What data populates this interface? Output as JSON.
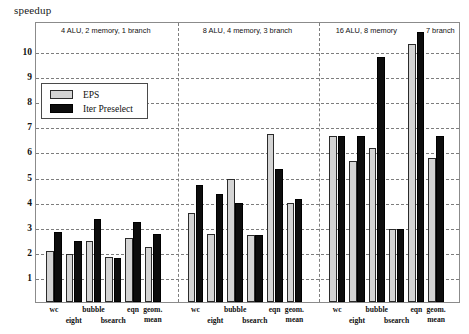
{
  "chart_data": {
    "type": "bar",
    "title": "",
    "ylabel": "speedup",
    "xlabel": "",
    "ylim": [
      0,
      11.2
    ],
    "yticks": [
      1,
      2,
      3,
      4,
      5,
      6,
      7,
      8,
      9,
      10
    ],
    "grid": true,
    "legend": {
      "position": "upper-left-inside",
      "entries": [
        {
          "name": "EPS",
          "color": "#d4d4d4"
        },
        {
          "name": "Iter Preselect",
          "color": "#0d0d0d"
        }
      ]
    },
    "categories": [
      "wc",
      "eight",
      "bubble",
      "bsearch",
      "eqn",
      "geom. mean"
    ],
    "groups": [
      {
        "title": "4 ALU, 2 memory, 1 branch",
        "series": [
          {
            "name": "EPS",
            "values": [
              2.05,
              1.93,
              2.43,
              1.79,
              2.56,
              2.19
            ]
          },
          {
            "name": "Iter Preselect",
            "values": [
              2.79,
              2.42,
              3.3,
              1.76,
              3.18,
              2.7
            ]
          }
        ]
      },
      {
        "title": "8 ALU, 4 memory, 3 branch",
        "series": [
          {
            "name": "EPS",
            "values": [
              3.56,
              2.7,
              4.92,
              2.68,
              6.7,
              3.95
            ]
          },
          {
            "name": "Iter Preselect",
            "values": [
              4.66,
              4.3,
              3.96,
              2.68,
              5.3,
              4.1
            ]
          }
        ]
      },
      {
        "title": "16 ALU, 8 memory, 7 branch",
        "title_left": "16 ALU, 8 memory",
        "title_right": "7 branch",
        "series": [
          {
            "name": "EPS",
            "values": [
              6.6,
              5.62,
              6.12,
              2.9,
              10.3,
              5.76
            ]
          },
          {
            "name": "Iter Preselect",
            "values": [
              6.6,
              6.6,
              9.78,
              2.9,
              10.78,
              6.6
            ]
          }
        ]
      }
    ]
  },
  "axis": {
    "y_title": "speedup",
    "tick_labels": [
      "10",
      "9",
      "8",
      "7",
      "6",
      "5",
      "4",
      "3",
      "2",
      "1"
    ]
  },
  "legend": {
    "eps_label": "EPS",
    "iter_label": "Iter Preselect"
  },
  "groups": {
    "g0_title": "4 ALU, 2 memory, 1 branch",
    "g1_title": "8 ALU, 4 memory, 3 branch",
    "g2_title_left": "16 ALU, 8 memory",
    "g2_title_right": "7 branch"
  },
  "xlabels": {
    "wc": "wc",
    "eight": "eight",
    "bubble": "bubble",
    "bsearch": "bsearch",
    "eqn": "eqn",
    "geom1": "geom.",
    "geom2": "mean"
  }
}
